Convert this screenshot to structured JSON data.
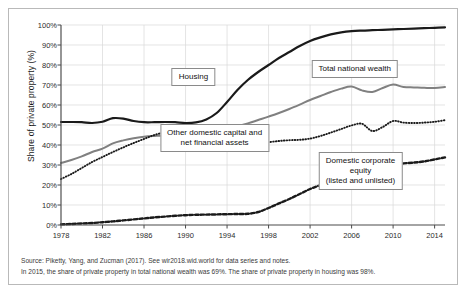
{
  "chart_data": {
    "type": "line",
    "title": "",
    "xlabel": "",
    "ylabel": "Share of private property (%)",
    "xlim": [
      1978,
      2015
    ],
    "ylim": [
      0,
      100
    ],
    "grid": true,
    "legend_position": "inline-annotations",
    "xticks": [
      "1978",
      "1982",
      "1986",
      "1990",
      "1994",
      "1998",
      "2002",
      "2006",
      "2010",
      "2014"
    ],
    "yticks": [
      "0%",
      "10%",
      "20%",
      "30%",
      "40%",
      "50%",
      "60%",
      "70%",
      "80%",
      "90%",
      "100%"
    ],
    "x": [
      1978,
      1979,
      1980,
      1981,
      1982,
      1983,
      1984,
      1985,
      1986,
      1987,
      1988,
      1989,
      1990,
      1991,
      1992,
      1993,
      1994,
      1995,
      1996,
      1997,
      1998,
      1999,
      2000,
      2001,
      2002,
      2003,
      2004,
      2005,
      2006,
      2007,
      2008,
      2009,
      2010,
      2011,
      2012,
      2013,
      2014,
      2015
    ],
    "series": [
      {
        "name": "Housing",
        "style": "solid-thick-black",
        "color": "#1a1a1a",
        "values": [
          51.5,
          51.5,
          51.4,
          51.0,
          51.6,
          53.4,
          53.2,
          52.0,
          51.4,
          51.4,
          51.5,
          51.4,
          51.0,
          51.3,
          52.8,
          56.0,
          61.5,
          67.5,
          72.5,
          76.5,
          80.0,
          83.5,
          86.5,
          89.5,
          92.0,
          93.8,
          95.3,
          96.3,
          96.9,
          97.2,
          97.4,
          97.6,
          97.8,
          98.0,
          98.2,
          98.4,
          98.6,
          98.8
        ]
      },
      {
        "name": "Total national wealth",
        "style": "solid-gray",
        "color": "#808080",
        "values": [
          31.0,
          32.5,
          34.3,
          36.5,
          38.2,
          40.8,
          42.3,
          43.4,
          44.1,
          44.5,
          44.8,
          44.7,
          44.6,
          45.2,
          46.0,
          47.0,
          48.2,
          49.4,
          50.8,
          52.5,
          54.2,
          56.0,
          58.0,
          60.2,
          62.5,
          64.5,
          66.5,
          68.2,
          69.2,
          67.3,
          66.5,
          68.5,
          70.2,
          69.0,
          68.8,
          68.6,
          68.5,
          69.0
        ]
      },
      {
        "name": "Other domestic capital and net financial assets",
        "style": "dotted-fine-black",
        "color": "#1a1a1a",
        "values": [
          23.0,
          25.5,
          28.5,
          31.5,
          34.0,
          36.5,
          38.8,
          41.0,
          43.0,
          45.0,
          46.2,
          46.3,
          46.0,
          45.5,
          43.5,
          41.8,
          41.0,
          40.5,
          40.4,
          40.8,
          41.4,
          42.0,
          42.4,
          42.6,
          43.2,
          44.5,
          46.2,
          48.0,
          49.8,
          50.6,
          47.0,
          49.0,
          52.0,
          51.2,
          51.0,
          51.2,
          51.6,
          52.4
        ]
      },
      {
        "name": "Domestic corporate equity (listed and unlisted)",
        "style": "dashed-thick-black",
        "color": "#1a1a1a",
        "values": [
          0.3,
          0.5,
          0.8,
          1.0,
          1.4,
          1.8,
          2.3,
          2.8,
          3.3,
          3.8,
          4.2,
          4.6,
          4.9,
          5.1,
          5.2,
          5.3,
          5.4,
          5.5,
          5.6,
          6.5,
          8.5,
          10.8,
          13.0,
          15.5,
          18.0,
          20.0,
          22.0,
          23.8,
          25.0,
          25.2,
          24.7,
          27.5,
          30.2,
          30.8,
          31.2,
          31.8,
          32.8,
          33.8
        ]
      }
    ],
    "annotations": [
      {
        "id": "housing",
        "text": "Housing",
        "x_pct": 34.5,
        "y_pct": 26.0
      },
      {
        "id": "total-national-wealth",
        "text": "Total national wealth",
        "x_pct": 76.5,
        "y_pct": 22.0
      },
      {
        "id": "other-domestic-capital",
        "text": "Other domestic capital and\nnet financial assets",
        "x_pct": 40.0,
        "y_pct": 56.5
      },
      {
        "id": "domestic-corporate-equity",
        "text": "Domestic corporate equity\n(listed and unlisted)",
        "x_pct": 78.0,
        "y_pct": 73.0
      }
    ]
  },
  "footer": {
    "source": "Source: Piketty, Yang, and Zucman (2017). See wir2018.wid.world for data series and notes.",
    "note": "In 2015, the share of private property in total national wealth was 69%. The share of private property in housing was 98%."
  },
  "colors": {
    "frame_border": "#b9b9b9",
    "grid": "#d8d8d8",
    "axis": "#4a4a4a",
    "housing": "#1a1a1a",
    "total_national_wealth": "#808080",
    "other_domestic_capital": "#1a1a1a",
    "domestic_corporate_equity": "#1a1a1a",
    "background": "#ffffff"
  }
}
